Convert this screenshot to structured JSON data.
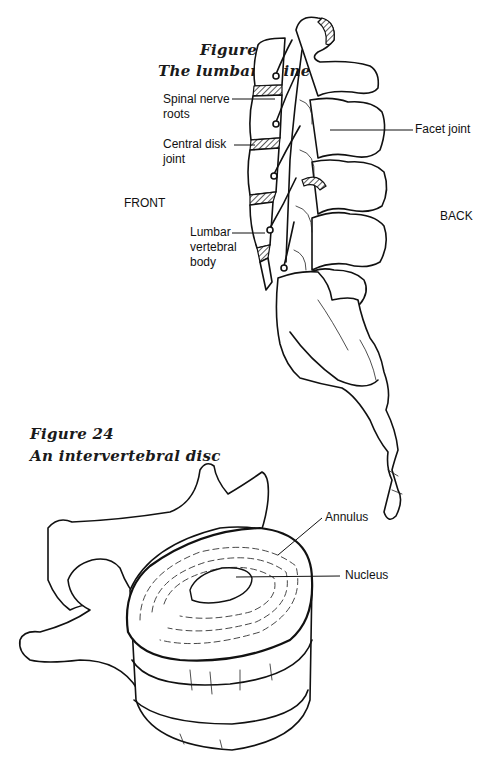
{
  "figure23": {
    "number": "Figure 23",
    "title": "The lumbar spine",
    "orientation": {
      "front": "FRONT",
      "back": "BACK"
    },
    "labels": {
      "spinal_nerve_roots": "Spinal nerve\nroots",
      "central_disk_joint": "Central disk\njoint",
      "lumbar_vertebral_body": "Lumbar\nvertebral\nbody",
      "facet_joint": "Facet joint"
    }
  },
  "figure24": {
    "number": "Figure 24",
    "title": "An intervertebral disc",
    "labels": {
      "annulus": "Annulus",
      "nucleus": "Nucleus"
    }
  }
}
